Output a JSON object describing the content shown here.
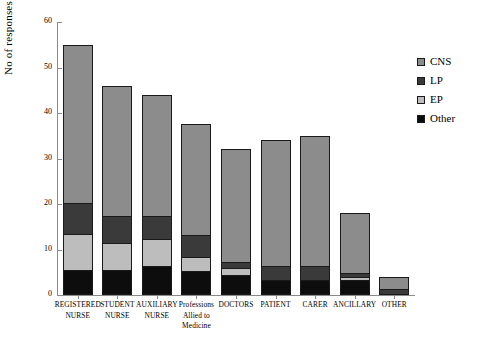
{
  "chart_data": {
    "type": "bar",
    "subtype": "stacked-bar",
    "title": "",
    "xlabel": "",
    "ylabel": "No of responses",
    "ylim": [
      0,
      60
    ],
    "yticks": [
      0,
      10,
      20,
      30,
      40,
      50,
      60
    ],
    "grid": false,
    "legend_position": "right",
    "categories": [
      "REGISTERED NURSE",
      "STUDENT NURSE",
      "AUXILIARY NURSE",
      "Professions Allied to Medicine",
      "DOCTORS",
      "PATIENT",
      "CARER",
      "ANCILLARY",
      "OTHER"
    ],
    "category_lines": [
      [
        "REGISTERED",
        "NURSE"
      ],
      [
        "STUDENT",
        "NURSE"
      ],
      [
        "AUXILIARY",
        "NURSE"
      ],
      [
        "Professions",
        "Allied to",
        "Medicine"
      ],
      [
        "DOCTORS"
      ],
      [
        "PATIENT"
      ],
      [
        "CARER"
      ],
      [
        "ANCILLARY"
      ],
      [
        "OTHER"
      ]
    ],
    "series": [
      {
        "name": "Other",
        "color": "#0d0d0d",
        "values": [
          5,
          5,
          6,
          5,
          4,
          3,
          3,
          3,
          0
        ]
      },
      {
        "name": "EP",
        "color": "#bdbdbd",
        "values": [
          8,
          6,
          6,
          3,
          1.5,
          0,
          0,
          0.5,
          0
        ]
      },
      {
        "name": "LP",
        "color": "#3a3a3a",
        "values": [
          7,
          6,
          5,
          5,
          1.5,
          3,
          3,
          1,
          1
        ]
      },
      {
        "name": "CNS",
        "color": "#8c8c8c",
        "values": [
          35,
          29,
          27,
          24.5,
          25,
          28,
          29,
          13.5,
          3
        ]
      }
    ],
    "totals": [
      55,
      46,
      44,
      37.5,
      32,
      34,
      35,
      18,
      4
    ]
  },
  "legend": {
    "entries": [
      {
        "label": "CNS",
        "color": "#8c8c8c"
      },
      {
        "label": "LP",
        "color": "#3a3a3a"
      },
      {
        "label": "EP",
        "color": "#bdbdbd"
      },
      {
        "label": "Other",
        "color": "#0d0d0d"
      }
    ]
  }
}
